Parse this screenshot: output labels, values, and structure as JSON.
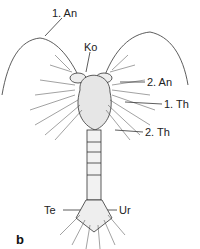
{
  "figure": {
    "panel_label": "b",
    "labels": {
      "first_antenna": "1. An",
      "head": "Ko",
      "second_antenna": "2. An",
      "first_thorax": "1. Th",
      "second_thorax": "2. Th",
      "telson": "Te",
      "uropod": "Ur"
    }
  }
}
